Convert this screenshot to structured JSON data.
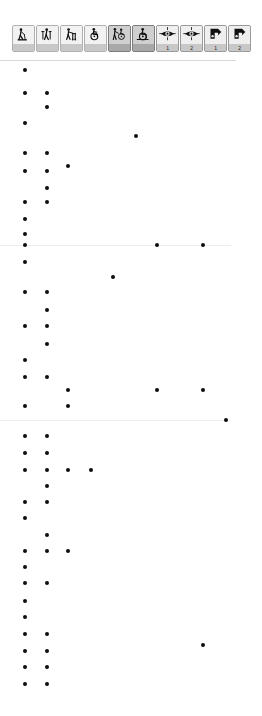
{
  "window": {
    "title": "Mobility / Accessibility Pictogram Palette",
    "width": 262,
    "height": 716,
    "background": "#ffffff"
  },
  "toolbar": {
    "name": "pictogram-toolbar",
    "button_count": 10,
    "buttons": [
      {
        "id": "walking-aid-cane",
        "icon": "person-with-cane-icon",
        "caption": "",
        "state": "light",
        "label": "Person with cane"
      },
      {
        "id": "walking-aid-crutches",
        "icon": "person-with-crutches-icon",
        "caption": "",
        "state": "light",
        "label": "Person with crutches"
      },
      {
        "id": "walker-frame",
        "icon": "person-with-walker-icon",
        "caption": "",
        "state": "light",
        "label": "Person with walker"
      },
      {
        "id": "wheelchair-manual",
        "icon": "wheelchair-icon",
        "caption": "",
        "state": "light",
        "label": "Manual wheelchair"
      },
      {
        "id": "wheelchair-assisted",
        "icon": "wheelchair-assisted-icon",
        "caption": "",
        "state": "pressed",
        "label": "Assisted wheelchair"
      },
      {
        "id": "wheelchair-electric",
        "icon": "wheelchair-electric-icon",
        "caption": "",
        "state": "pressed",
        "label": "Electric wheelchair"
      },
      {
        "id": "vision-level-1",
        "icon": "eye-icon",
        "caption": "1",
        "state": "normal",
        "label": "Vision level 1"
      },
      {
        "id": "vision-level-2",
        "icon": "eye-icon",
        "caption": "2",
        "state": "normal",
        "label": "Vision level 2"
      },
      {
        "id": "hearing-sign-level-1",
        "icon": "hand-sign-icon",
        "caption": "1",
        "state": "normal",
        "label": "Sign language level 1"
      },
      {
        "id": "hearing-sign-level-2",
        "icon": "hand-sign-icon",
        "caption": "2",
        "state": "normal",
        "label": "Sign language level 2"
      }
    ]
  },
  "separator": {
    "name": "toolbar-separator",
    "color": "#d9d9d9",
    "width": 236
  },
  "chart_data": {
    "type": "scatter",
    "title": "",
    "xlabel": "",
    "ylabel": "",
    "xlim": [
      0,
      262
    ],
    "ylim": [
      0,
      655
    ],
    "grid": false,
    "legend": "none",
    "marker_color": "#0d0d0d",
    "marker_size": 4,
    "point_count": 71,
    "columns_px": [
      25,
      47,
      68,
      91,
      113,
      157,
      180,
      203,
      226
    ],
    "points": [
      {
        "x": 25,
        "y": 9
      },
      {
        "x": 25,
        "y": 32
      },
      {
        "x": 47,
        "y": 32
      },
      {
        "x": 47,
        "y": 46
      },
      {
        "x": 25,
        "y": 62
      },
      {
        "x": 136,
        "y": 75
      },
      {
        "x": 25,
        "y": 92
      },
      {
        "x": 47,
        "y": 92
      },
      {
        "x": 25,
        "y": 110
      },
      {
        "x": 47,
        "y": 110
      },
      {
        "x": 68,
        "y": 105
      },
      {
        "x": 47,
        "y": 127
      },
      {
        "x": 25,
        "y": 141
      },
      {
        "x": 47,
        "y": 141
      },
      {
        "x": 25,
        "y": 158
      },
      {
        "x": 25,
        "y": 173
      },
      {
        "x": 25,
        "y": 184
      },
      {
        "x": 157,
        "y": 184
      },
      {
        "x": 203,
        "y": 184
      },
      {
        "x": 25,
        "y": 201
      },
      {
        "x": 113,
        "y": 216
      },
      {
        "x": 25,
        "y": 231
      },
      {
        "x": 47,
        "y": 231
      },
      {
        "x": 47,
        "y": 249
      },
      {
        "x": 25,
        "y": 265
      },
      {
        "x": 47,
        "y": 265
      },
      {
        "x": 47,
        "y": 283
      },
      {
        "x": 25,
        "y": 299
      },
      {
        "x": 25,
        "y": 316
      },
      {
        "x": 47,
        "y": 316
      },
      {
        "x": 68,
        "y": 329
      },
      {
        "x": 157,
        "y": 329
      },
      {
        "x": 203,
        "y": 329
      },
      {
        "x": 25,
        "y": 345
      },
      {
        "x": 68,
        "y": 345
      },
      {
        "x": 226,
        "y": 359
      },
      {
        "x": 25,
        "y": 375
      },
      {
        "x": 47,
        "y": 375
      },
      {
        "x": 25,
        "y": 392
      },
      {
        "x": 47,
        "y": 392
      },
      {
        "x": 25,
        "y": 409
      },
      {
        "x": 47,
        "y": 409
      },
      {
        "x": 68,
        "y": 409
      },
      {
        "x": 91,
        "y": 409
      },
      {
        "x": 47,
        "y": 425
      },
      {
        "x": 25,
        "y": 441
      },
      {
        "x": 47,
        "y": 441
      },
      {
        "x": 25,
        "y": 457
      },
      {
        "x": 47,
        "y": 474
      },
      {
        "x": 25,
        "y": 490
      },
      {
        "x": 47,
        "y": 490
      },
      {
        "x": 68,
        "y": 490
      },
      {
        "x": 25,
        "y": 506
      },
      {
        "x": 25,
        "y": 522
      },
      {
        "x": 47,
        "y": 522
      },
      {
        "x": 25,
        "y": 540
      },
      {
        "x": 25,
        "y": 556
      },
      {
        "x": 25,
        "y": 573
      },
      {
        "x": 47,
        "y": 573
      },
      {
        "x": 25,
        "y": 590
      },
      {
        "x": 47,
        "y": 590
      },
      {
        "x": 203,
        "y": 584
      },
      {
        "x": 25,
        "y": 606
      },
      {
        "x": 47,
        "y": 606
      },
      {
        "x": 25,
        "y": 623
      },
      {
        "x": 47,
        "y": 623
      }
    ],
    "hairlines_y": [
      184,
      359
    ]
  }
}
